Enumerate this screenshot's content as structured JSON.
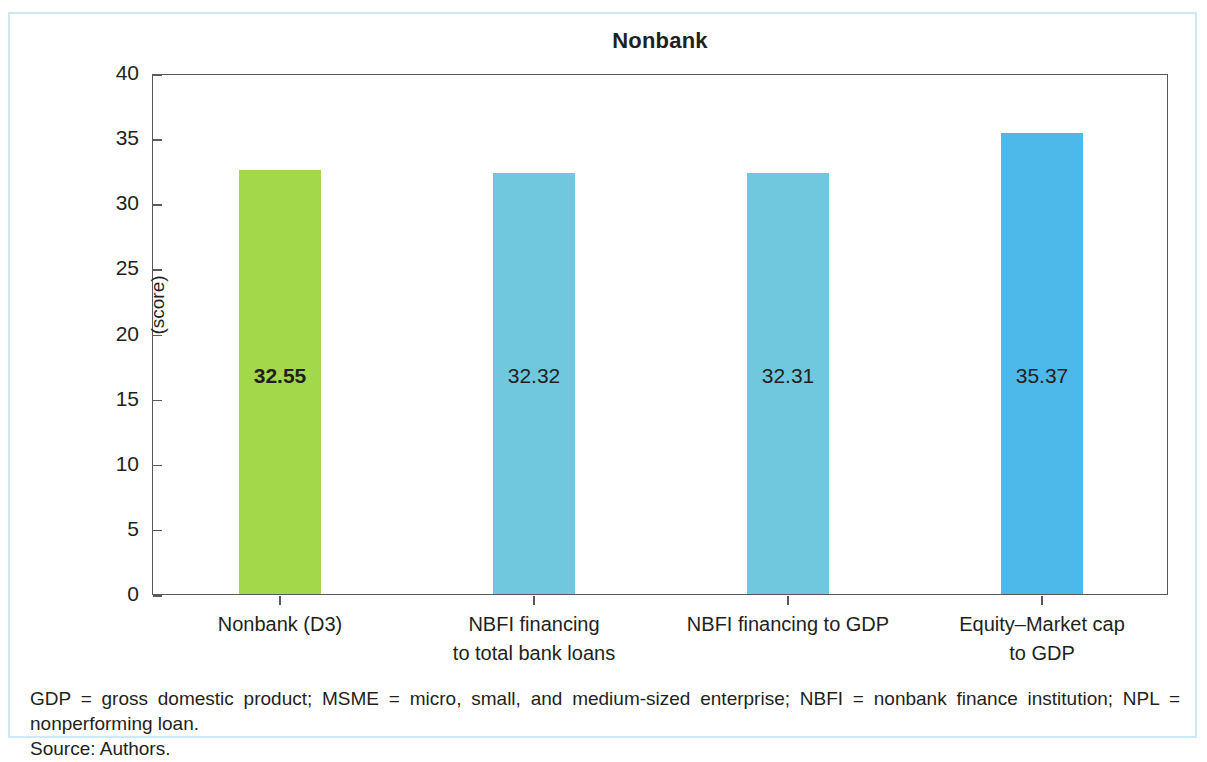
{
  "figure": {
    "title": "Nonbank",
    "y_axis_title": "(score)",
    "notes": {
      "abbreviations": "GDP = gross domestic product; MSME = micro, small, and medium-sized enterprise; NBFI = nonbank finance institution; NPL = nonperforming loan.",
      "source": "Source: Authors."
    },
    "frame_color": "#cfe8f2"
  },
  "chart_data": {
    "type": "bar",
    "title": "Nonbank",
    "xlabel": "",
    "ylabel": "(score)",
    "ylim": [
      0,
      40
    ],
    "yticks": [
      "0",
      "5",
      "10",
      "15",
      "20",
      "25",
      "30",
      "35",
      "40"
    ],
    "grid": false,
    "legend": "none",
    "categories": [
      "Nonbank (D3)",
      "NBFI financing\nto total bank loans",
      "NBFI financing to GDP",
      "Equity–Market cap\nto GDP"
    ],
    "values": [
      32.55,
      32.32,
      32.31,
      35.37
    ],
    "data_labels": [
      "32.55",
      "32.32",
      "32.31",
      "35.37"
    ],
    "colors": [
      "#a3d84a",
      "#6fc8dd",
      "#6fc8dd",
      "#4db8ea"
    ],
    "bars": [
      {
        "label_line1": "Nonbank (D3)",
        "label_line2": "",
        "value": 32.55,
        "value_text": "32.55",
        "color": "#a3d84a",
        "emphasis": "bold"
      },
      {
        "label_line1": "NBFI financing",
        "label_line2": "to total bank loans",
        "value": 32.32,
        "value_text": "32.32",
        "color": "#6fc8dd",
        "emphasis": "normal"
      },
      {
        "label_line1": "NBFI financing to GDP",
        "label_line2": "",
        "value": 32.31,
        "value_text": "32.31",
        "color": "#6fc8dd",
        "emphasis": "normal"
      },
      {
        "label_line1": "Equity–Market cap",
        "label_line2": "to GDP",
        "value": 35.37,
        "value_text": "35.37",
        "color": "#4db8ea",
        "emphasis": "normal"
      }
    ]
  }
}
